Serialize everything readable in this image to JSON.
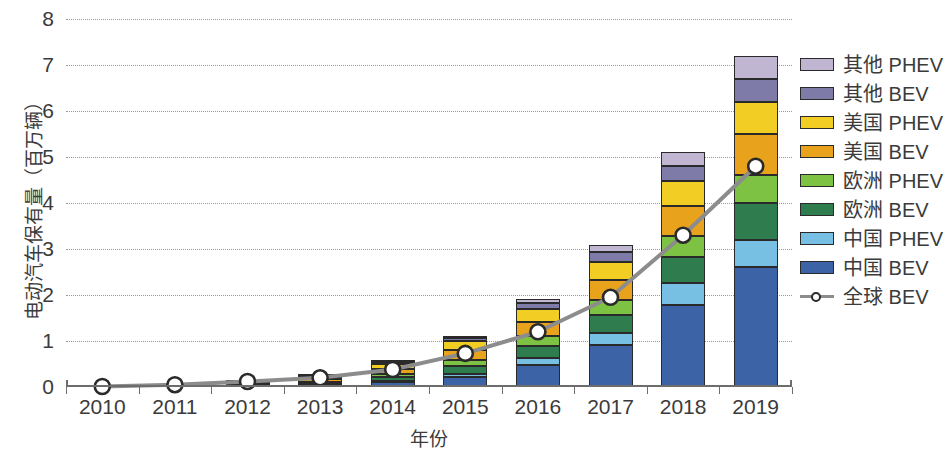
{
  "chart_data": {
    "type": "bar",
    "subtype": "stacked-bar-with-line-overlay",
    "title": "",
    "xlabel": "年份",
    "ylabel": "电动汽车保有量（百万辆）",
    "categories": [
      "2010",
      "2011",
      "2012",
      "2013",
      "2014",
      "2015",
      "2016",
      "2017",
      "2018",
      "2019"
    ],
    "ylim": [
      0,
      8
    ],
    "yticks": [
      0,
      1,
      2,
      3,
      4,
      5,
      6,
      7,
      8
    ],
    "ytick_labels": [
      "0",
      "1",
      "2",
      "3",
      "4",
      "5",
      "6",
      "7",
      "8"
    ],
    "grid": true,
    "grid_style": "dotted-horizontal",
    "legend_position": "right",
    "stack_order_bottom_to_top": [
      "中国 BEV",
      "中国 PHEV",
      "欧洲 BEV",
      "欧洲 PHEV",
      "美国 BEV",
      "美国 PHEV",
      "其他 BEV",
      "其他 PHEV"
    ],
    "series": [
      {
        "name": "中国 BEV",
        "type": "bar",
        "color": "#3b63a6",
        "values": [
          0.0,
          0.01,
          0.02,
          0.04,
          0.1,
          0.22,
          0.48,
          0.92,
          1.78,
          2.6
        ]
      },
      {
        "name": "中国 PHEV",
        "type": "bar",
        "color": "#77c0e3",
        "values": [
          0.0,
          0.0,
          0.0,
          0.01,
          0.03,
          0.07,
          0.14,
          0.26,
          0.48,
          0.6
        ]
      },
      {
        "name": "欧洲 BEV",
        "type": "bar",
        "color": "#2f7d4f",
        "values": [
          0.0,
          0.01,
          0.02,
          0.04,
          0.09,
          0.17,
          0.27,
          0.39,
          0.56,
          0.8
        ]
      },
      {
        "name": "欧洲 PHEV",
        "type": "bar",
        "color": "#7dc242",
        "values": [
          0.0,
          0.0,
          0.01,
          0.02,
          0.06,
          0.13,
          0.22,
          0.33,
          0.46,
          0.6
        ]
      },
      {
        "name": "美国 BEV",
        "type": "bar",
        "color": "#e8a21c",
        "values": [
          0.0,
          0.01,
          0.03,
          0.06,
          0.12,
          0.21,
          0.3,
          0.42,
          0.65,
          0.9
        ]
      },
      {
        "name": "美国 PHEV",
        "type": "bar",
        "color": "#f2cd23",
        "values": [
          0.0,
          0.0,
          0.02,
          0.05,
          0.1,
          0.19,
          0.29,
          0.4,
          0.55,
          0.7
        ]
      },
      {
        "name": "其他 BEV",
        "type": "bar",
        "color": "#7f7ba8",
        "values": [
          0.0,
          0.0,
          0.01,
          0.02,
          0.04,
          0.07,
          0.13,
          0.22,
          0.33,
          0.5
        ]
      },
      {
        "name": "其他 PHEV",
        "type": "bar",
        "color": "#c0b6d2",
        "values": [
          0.0,
          0.0,
          0.0,
          0.01,
          0.02,
          0.04,
          0.08,
          0.14,
          0.3,
          0.5
        ]
      },
      {
        "name": "全球 BEV",
        "type": "line",
        "color": "#8c8c8c",
        "marker": "circle-open",
        "values": [
          0.01,
          0.05,
          0.12,
          0.2,
          0.38,
          0.73,
          1.2,
          1.95,
          3.3,
          4.8
        ]
      }
    ],
    "totals": [
      0.01,
      0.03,
      0.11,
      0.25,
      0.56,
      1.1,
      1.91,
      3.08,
      5.11,
      7.2
    ]
  },
  "legend": {
    "items": [
      {
        "label": "其他 PHEV",
        "color": "#c0b6d2",
        "kind": "swatch"
      },
      {
        "label": "其他 BEV",
        "color": "#7f7ba8",
        "kind": "swatch"
      },
      {
        "label": "美国 PHEV",
        "color": "#f2cd23",
        "kind": "swatch"
      },
      {
        "label": "美国 BEV",
        "color": "#e8a21c",
        "kind": "swatch"
      },
      {
        "label": "欧洲 PHEV",
        "color": "#7dc242",
        "kind": "swatch"
      },
      {
        "label": "欧洲 BEV",
        "color": "#2f7d4f",
        "kind": "swatch"
      },
      {
        "label": "中国 PHEV",
        "color": "#77c0e3",
        "kind": "swatch"
      },
      {
        "label": "中国 BEV",
        "color": "#3b63a6",
        "kind": "swatch"
      },
      {
        "label": "全球 BEV",
        "color": "#8c8c8c",
        "kind": "line-marker"
      }
    ]
  },
  "axes": {
    "y_title": "电动汽车保有量（百万辆）",
    "x_title": "年份"
  },
  "colors": {
    "axis": "#6d6d6d",
    "grid": "#9a9a9a",
    "text": "#3b3b3b",
    "line": "#8c8c8c",
    "marker_fill": "#ffffff",
    "marker_stroke": "#2a2a2a",
    "bar_outline": "#2a2a2a",
    "background": "#ffffff"
  }
}
